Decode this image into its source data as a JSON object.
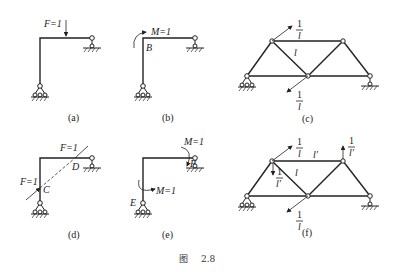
{
  "figure": {
    "caption_prefix": "图",
    "caption_number": "2.8"
  },
  "panels": [
    {
      "id": "a",
      "caption": "(a)",
      "labels": {
        "force": "F=1"
      }
    },
    {
      "id": "b",
      "caption": "(b)",
      "labels": {
        "moment": "M=1",
        "point": "B"
      }
    },
    {
      "id": "c",
      "caption": "(c)",
      "labels": {
        "top_numer": "1",
        "top_denom": "l",
        "member": "l",
        "bottom_numer": "1",
        "bottom_denom": "l"
      }
    },
    {
      "id": "d",
      "caption": "(d)",
      "labels": {
        "force_top": "F=1",
        "force_left": "F=1",
        "point_c": "C",
        "point_d": "D"
      }
    },
    {
      "id": "e",
      "caption": "(e)",
      "labels": {
        "moment_top": "M=1",
        "moment_left": "M=1",
        "point_e": "E",
        "point_f": "F"
      }
    },
    {
      "id": "f",
      "caption": "(f)",
      "labels": {
        "top_numer": "1",
        "top_denom": "l",
        "member_top": "l′",
        "right_numer": "1",
        "right_denom": "l′",
        "mid_numer": "1",
        "mid_denom": "l′",
        "member": "l",
        "bottom_numer": "1",
        "bottom_denom": "l"
      }
    }
  ]
}
